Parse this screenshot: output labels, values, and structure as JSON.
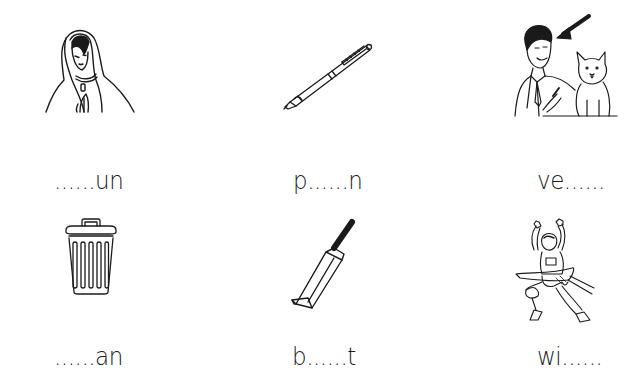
{
  "worksheet": {
    "type": "fill-in-the-missing-letters",
    "items": [
      {
        "row": 1,
        "col": 1,
        "picture": "praying-woman-veil",
        "word": "......un"
      },
      {
        "row": 1,
        "col": 2,
        "picture": "ballpoint-pen",
        "word": "p......n"
      },
      {
        "row": 1,
        "col": 3,
        "picture": "vet-with-dog",
        "word": "ve......"
      },
      {
        "row": 2,
        "col": 1,
        "picture": "trash-can",
        "word": "......an"
      },
      {
        "row": 2,
        "col": 2,
        "picture": "cricket-bat",
        "word": "b......t"
      },
      {
        "row": 2,
        "col": 3,
        "picture": "runner-winning-race",
        "word": "wi......"
      }
    ]
  },
  "colors": {
    "ink": "#1a1a1a",
    "background": "#ffffff"
  }
}
